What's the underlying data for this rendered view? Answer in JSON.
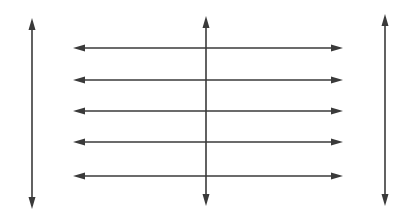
{
  "diagram": {
    "background": "#ffffff",
    "stroke_color": "#3a3a3a",
    "stroke_width": 1.6,
    "vertical_arrows": [
      {
        "id": "left",
        "x": 32,
        "y1": 18,
        "y2": 209,
        "heads": "both"
      },
      {
        "id": "middle",
        "x": 206,
        "y1": 16,
        "y2": 206,
        "heads": "both"
      },
      {
        "id": "right",
        "x": 385,
        "y1": 14,
        "y2": 206,
        "heads": "both"
      }
    ],
    "horizontal_arrows": [
      {
        "id": "row-1",
        "y": 48,
        "x1": 73,
        "x2": 343,
        "heads": "both"
      },
      {
        "id": "row-2",
        "y": 80,
        "x1": 73,
        "x2": 343,
        "heads": "both"
      },
      {
        "id": "row-3",
        "y": 111,
        "x1": 73,
        "x2": 343,
        "heads": "both"
      },
      {
        "id": "row-4",
        "y": 142,
        "x1": 73,
        "x2": 343,
        "heads": "both"
      },
      {
        "id": "row-5",
        "y": 176,
        "x1": 73,
        "x2": 343,
        "heads": "both"
      }
    ]
  }
}
